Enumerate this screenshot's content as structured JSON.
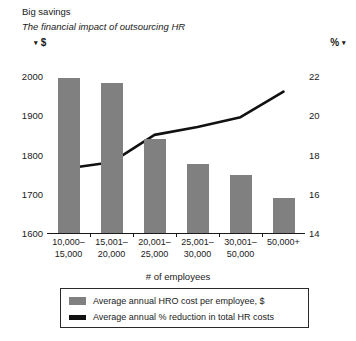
{
  "header": {
    "title": "Big savings",
    "subtitle": "The financial impact of outsourcing HR",
    "left_unit": "$",
    "right_unit": "%",
    "left_caret": "▾",
    "right_caret": "▾"
  },
  "legend": {
    "items": [
      {
        "label": "Average annual HRO cost per employee, $",
        "marker": "bar",
        "color": "#808080"
      },
      {
        "label": "Average annual % reduction in total HR costs",
        "marker": "line",
        "color": "#111111"
      }
    ]
  },
  "chart_data": {
    "type": "bar",
    "title": "Big savings",
    "subtitle": "The financial impact of outsourcing HR",
    "xlabel": "# of employees",
    "ylabel": "$",
    "y2label": "%",
    "categories": [
      "10,000–\n15,000",
      "15,001–\n20,000",
      "20,001–\n25,000",
      "25,001–\n30,000",
      "30,001–\n50,000",
      "50,000+"
    ],
    "ylim": [
      1600,
      2000
    ],
    "yticks": [
      1600,
      1700,
      1800,
      1900,
      2000
    ],
    "y2lim": [
      14,
      22
    ],
    "y2ticks": [
      14,
      16,
      18,
      20,
      22
    ],
    "grid": false,
    "legend_position": "bottom",
    "series": [
      {
        "name": "Average annual HRO cost per employee, $",
        "type": "bar",
        "axis": "left",
        "color": "#808080",
        "values": [
          1995,
          1982,
          1840,
          1775,
          1748,
          1690
        ]
      },
      {
        "name": "Average annual % reduction in total HR costs",
        "type": "line",
        "axis": "right",
        "color": "#111111",
        "values": [
          17.3,
          17.6,
          19.0,
          19.4,
          19.9,
          21.2
        ]
      }
    ]
  }
}
